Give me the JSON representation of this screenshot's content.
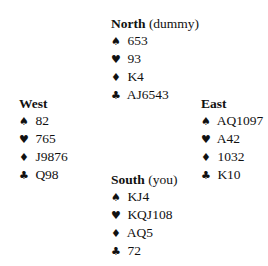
{
  "suit_icons": {
    "spades": "♠",
    "hearts": "♥",
    "diamonds": "♦",
    "clubs": "♣"
  },
  "hands": {
    "north": {
      "name": "North",
      "role": "(dummy)",
      "spades": "653",
      "hearts": "93",
      "diamonds": "K4",
      "clubs": "AJ6543"
    },
    "west": {
      "name": "West",
      "role": "",
      "spades": "82",
      "hearts": "765",
      "diamonds": "J9876",
      "clubs": "Q98"
    },
    "east": {
      "name": "East",
      "role": "",
      "spades": "AQ1097",
      "hearts": "A42",
      "diamonds": "1032",
      "clubs": "K10"
    },
    "south": {
      "name": "South",
      "role": "(you)",
      "spades": "KJ4",
      "hearts": "KQJ108",
      "diamonds": "AQ5",
      "clubs": "72"
    }
  }
}
